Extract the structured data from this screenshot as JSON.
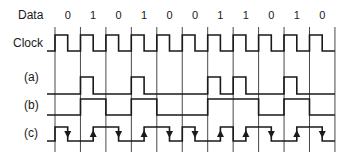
{
  "labels": {
    "data": "Data",
    "clock": "Clock",
    "a": "(a)",
    "b": "(b)",
    "c": "(c)"
  },
  "data_bits": [
    "0",
    "1",
    "0",
    "1",
    "0",
    "0",
    "1",
    "1",
    "0",
    "1",
    "0"
  ],
  "encodings": {
    "clock": "square wave, high first half of each bit period",
    "a": "return-to-zero pulse in first half of period for each 1",
    "b": "NRZ level follows data bit",
    "c": "Manchester: 0 = falling mid-bit (down arrow), 1 = rising mid-bit (up arrow)"
  },
  "colors": {
    "line": "#1a1a1a",
    "grid": "#333333",
    "background": "#ffffff"
  },
  "layout": {
    "grid_x0": 55,
    "bit_width": 25.45,
    "grid_top": 27,
    "grid_bottom": 152,
    "clock": {
      "hi": 35,
      "lo": 51,
      "lead_x": 47
    },
    "a": {
      "hi": 77,
      "lo": 94,
      "lead_x": 47
    },
    "b": {
      "hi": 99,
      "lo": 115,
      "lead_x": 47
    },
    "c": {
      "hi": 127,
      "lo": 141,
      "lead_x": 47
    }
  }
}
